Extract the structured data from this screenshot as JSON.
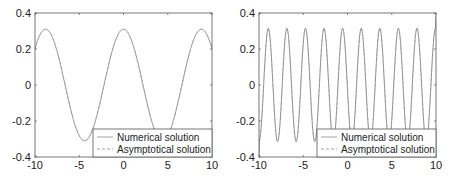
{
  "chart_data": [
    {
      "type": "line",
      "title": "",
      "xlabel": "",
      "ylabel": "",
      "xlim": [
        -10,
        10
      ],
      "ylim": [
        -0.4,
        0.4
      ],
      "xticks": [
        -10,
        -5,
        0,
        5,
        10
      ],
      "xtick_labels": [
        "-10",
        "-5",
        "0",
        "5",
        "10"
      ],
      "yticks": [
        -0.4,
        -0.2,
        0,
        0.2,
        0.4
      ],
      "ytick_labels": [
        "-0.4",
        "-0.2",
        "0",
        "0.2",
        "0.4"
      ],
      "grid": false,
      "legend_position": "lower right",
      "legend": [
        "Numerical solution",
        "Asymptotical solution"
      ],
      "model": {
        "amplitude": 0.31,
        "period": 8.8,
        "phase_peak_x": 0
      },
      "series": [
        {
          "name": "Numerical solution",
          "style": "solid",
          "x": [
            -10,
            -8.8,
            -6.6,
            -4.4,
            -2.2,
            0,
            2.2,
            4.4,
            6.6,
            8.8,
            10
          ],
          "y": [
            0.2,
            0.295,
            0.0,
            -0.32,
            0.0,
            0.305,
            0.0,
            -0.32,
            0.0,
            0.295,
            0.2
          ]
        },
        {
          "name": "Asymptotical solution",
          "style": "dashed",
          "x": [
            -10,
            -8.8,
            -6.6,
            -4.4,
            -2.2,
            0,
            2.2,
            4.4,
            6.6,
            8.8,
            10
          ],
          "y": [
            0.2,
            0.295,
            0.0,
            -0.32,
            0.0,
            0.305,
            0.0,
            -0.32,
            0.0,
            0.295,
            0.2
          ]
        }
      ]
    },
    {
      "type": "line",
      "title": "",
      "xlabel": "",
      "ylabel": "",
      "xlim": [
        -10,
        10
      ],
      "ylim": [
        -0.4,
        0.4
      ],
      "xticks": [
        -10,
        -5,
        0,
        5,
        10
      ],
      "xtick_labels": [
        "-10",
        "-5",
        "0",
        "5",
        "10"
      ],
      "yticks": [
        -0.4,
        -0.2,
        0,
        0.2,
        0.4
      ],
      "ytick_labels": [
        "-0.4",
        "-0.2",
        "0",
        "0.2",
        "0.4"
      ],
      "grid": false,
      "legend_position": "lower right",
      "legend": [
        "Numerical solution",
        "Asymptotical solution"
      ],
      "model": {
        "amplitude": 0.315,
        "period": 2.1,
        "phase_peak_x": -8.95
      },
      "series": [
        {
          "name": "Numerical solution",
          "style": "solid",
          "x": [
            -10,
            -8.95,
            -7.9,
            -6.85,
            -5.8,
            -4.75,
            -3.7,
            -2.65,
            -1.6,
            -0.55,
            0.5,
            1.55,
            2.6,
            3.65,
            4.7,
            5.75,
            6.8,
            7.85,
            8.9,
            10
          ],
          "y": [
            -0.4,
            0.31,
            -0.31,
            0.31,
            -0.31,
            0.31,
            -0.31,
            0.31,
            -0.31,
            0.31,
            -0.31,
            0.31,
            -0.31,
            0.31,
            -0.31,
            0.31,
            -0.31,
            0.31,
            -0.31,
            0.38
          ]
        },
        {
          "name": "Asymptotical solution",
          "style": "dashed",
          "x": [
            -10,
            -8.95,
            -7.9,
            -6.85,
            -5.8,
            -4.75,
            -3.7,
            -2.65,
            -1.6,
            -0.55,
            0.5,
            1.55,
            2.6,
            3.65,
            4.7,
            5.75,
            6.8,
            7.85,
            8.9,
            10
          ],
          "y": [
            -0.4,
            0.31,
            -0.31,
            0.31,
            -0.31,
            0.31,
            -0.31,
            0.31,
            -0.31,
            0.31,
            -0.31,
            0.31,
            -0.31,
            0.31,
            -0.31,
            0.31,
            -0.31,
            0.31,
            -0.31,
            0.38
          ]
        }
      ]
    }
  ],
  "colors": {
    "axes": "#555555",
    "curve": "#8a8a8a",
    "legend_border": "#555555",
    "text": "#222222"
  }
}
